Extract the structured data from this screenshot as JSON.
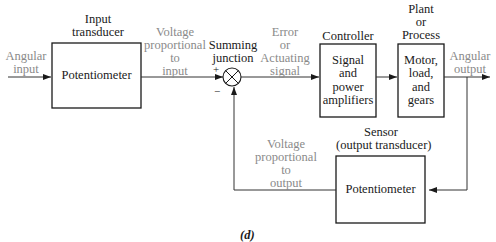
{
  "diagram": {
    "caption": "(d)",
    "colors": {
      "line": "#333333",
      "signal_label": "#8a8a8a",
      "block_label": "#1a1a1a"
    },
    "signals": {
      "angular_input": [
        "Angular",
        "input"
      ],
      "voltage_input": [
        "Voltage",
        "proportional",
        "to",
        "input"
      ],
      "error": [
        "Error",
        "or",
        "Actuating",
        "signal"
      ],
      "angular_output": [
        "Angular",
        "output"
      ],
      "voltage_output": [
        "Voltage",
        "proportional",
        "to",
        "output"
      ]
    },
    "blocks": {
      "input_transducer": {
        "title": [
          "Input",
          "transducer"
        ],
        "body": [
          "Potentiometer"
        ]
      },
      "summing_junction": {
        "title": [
          "Summing",
          "junction"
        ],
        "plus": "+",
        "minus": "−"
      },
      "controller": {
        "title": [
          "Controller"
        ],
        "body": [
          "Signal",
          "and",
          "power",
          "amplifiers"
        ]
      },
      "plant": {
        "title": [
          "Plant",
          "or",
          "Process"
        ],
        "body": [
          "Motor,",
          "load,",
          "and",
          "gears"
        ]
      },
      "sensor": {
        "title": [
          "Sensor",
          "(output transducer)"
        ],
        "body": [
          "Potentiometer"
        ]
      }
    }
  }
}
